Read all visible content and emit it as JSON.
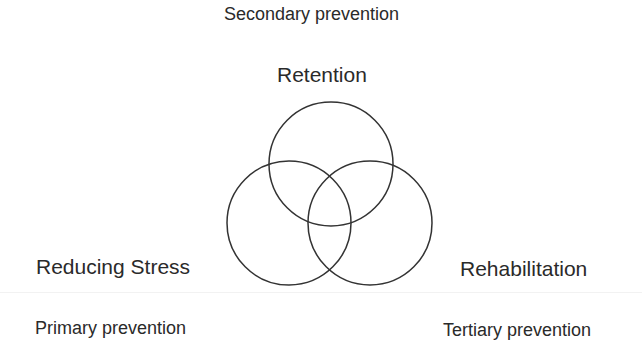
{
  "diagram": {
    "title": "Secondary prevention",
    "circles": [
      {
        "name": "Retention",
        "cx": 331,
        "cy": 164,
        "r": 62
      },
      {
        "name": "Reducing Stress",
        "cx": 289,
        "cy": 223,
        "r": 62
      },
      {
        "name": "Rehabilitation",
        "cx": 370,
        "cy": 223,
        "r": 62
      }
    ],
    "labels": {
      "top": "Retention",
      "left": "Reducing Stress",
      "right": "Rehabilitation"
    },
    "captions": {
      "top": "Secondary prevention",
      "left": "Primary prevention",
      "right": "Tertiary prevention"
    },
    "stroke_color": "#333333"
  }
}
